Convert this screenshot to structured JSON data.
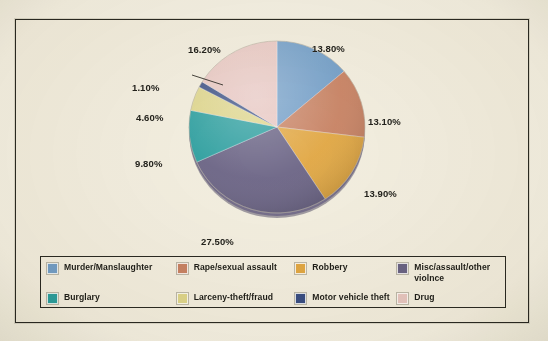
{
  "chart_data": {
    "type": "pie",
    "title": "",
    "legend_position": "bottom",
    "labels": [
      "Murder/Manslaughter",
      "Rape/sexual assault",
      "Robbery",
      "Misc/assault/other violnce",
      "Burglary",
      "Larceny-theft/fraud",
      "Motor vehicle theft",
      "Drug"
    ],
    "values": [
      13.8,
      13.1,
      13.9,
      27.5,
      9.8,
      4.6,
      1.1,
      16.2
    ],
    "value_labels": [
      "13.80%",
      "13.10%",
      "13.90%",
      "27.50%",
      "9.80%",
      "4.60%",
      "1.10%",
      "16.20%"
    ],
    "colors": [
      "#74a0cb",
      "#c98364",
      "#e2a843",
      "#6b6486",
      "#2da0a1",
      "#dfd78d",
      "#3a4f85",
      "#e9c8c4"
    ],
    "units": "percent",
    "total": 100.0,
    "start_angle_deg": 0,
    "direction": "clockwise"
  },
  "slices": [
    {
      "label": "Murder/Manslaughter",
      "pct": "13.80%",
      "value": 13.8,
      "color": "#74a0cb"
    },
    {
      "label": "Rape/sexual assault",
      "pct": "13.10%",
      "value": 13.1,
      "color": "#c98364"
    },
    {
      "label": "Robbery",
      "pct": "13.90%",
      "value": 13.9,
      "color": "#e2a843"
    },
    {
      "label": "Misc/assault/other violnce",
      "pct": "27.50%",
      "value": 27.5,
      "color": "#6b6486"
    },
    {
      "label": "Burglary",
      "pct": "9.80%",
      "value": 9.8,
      "color": "#2da0a1"
    },
    {
      "label": "Larceny-theft/fraud",
      "pct": "4.60%",
      "value": 4.6,
      "color": "#dfd78d"
    },
    {
      "label": "Motor vehicle theft",
      "pct": "1.10%",
      "value": 1.1,
      "color": "#3a4f85"
    },
    {
      "label": "Drug",
      "pct": "16.20%",
      "value": 16.2,
      "color": "#e9c8c4"
    }
  ],
  "legend": {
    "rows": [
      [
        {
          "label": "Murder/Manslaughter",
          "color": "#74a0cb"
        },
        {
          "label": "Rape/sexual assault",
          "color": "#c98364"
        },
        {
          "label": "Robbery",
          "color": "#e2a843"
        },
        {
          "label": "Misc/assault/other violnce",
          "color": "#6b6486"
        }
      ],
      [
        {
          "label": "Burglary",
          "color": "#2da0a1"
        },
        {
          "label": "Larceny-theft/fraud",
          "color": "#dfd78d"
        },
        {
          "label": "Motor vehicle theft",
          "color": "#3a4f85"
        },
        {
          "label": "Drug",
          "color": "#e9c8c4"
        }
      ]
    ]
  },
  "theme": {
    "paper": "#f6f3e8",
    "panel": "#f4f0e3",
    "frame_line": "#2b2a22",
    "text": "#23221c"
  }
}
